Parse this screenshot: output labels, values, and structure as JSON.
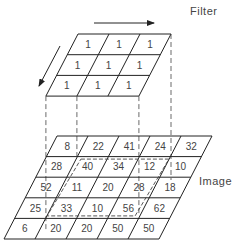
{
  "labels": {
    "filter": "Filter",
    "image": "Image"
  },
  "filter": {
    "rows": 3,
    "cols": 3,
    "values": [
      [
        "1",
        "1",
        "1"
      ],
      [
        "1",
        "1",
        "1"
      ],
      [
        "1",
        "1",
        "1"
      ]
    ]
  },
  "image": {
    "rows": 5,
    "cols": 5,
    "values": [
      [
        "8",
        "22",
        "41",
        "24",
        "32"
      ],
      [
        "28",
        "40",
        "34",
        "12",
        "10"
      ],
      [
        "52",
        "11",
        "20",
        "28",
        "18"
      ],
      [
        "25",
        "33",
        "10",
        "56",
        "62"
      ],
      [
        "6",
        "20",
        "20",
        "50",
        "50"
      ]
    ],
    "highlight": {
      "row_start": 1,
      "col_start": 1,
      "rows": 3,
      "cols": 3
    }
  },
  "arrows": {
    "horizontal": "right",
    "diagonal": "down-left"
  },
  "colors": {
    "line": "#222222",
    "text": "#444444",
    "background": "#ffffff"
  }
}
